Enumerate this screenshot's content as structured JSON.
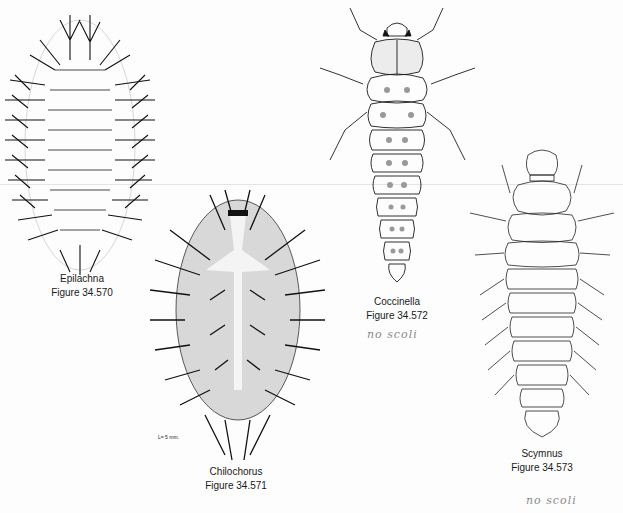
{
  "page": {
    "background": "#fdfdfd",
    "ink_color": "#111111",
    "pencil_color": "#8a8a8a"
  },
  "figures": [
    {
      "id": "epilachna",
      "genus": "Epilachna",
      "figure_number": "Figure 34.570",
      "annotation": ""
    },
    {
      "id": "chilochorus",
      "genus": "Chilochorus",
      "figure_number": "Figure 34.571",
      "scale_label": "L= 5 mm.",
      "annotation": ""
    },
    {
      "id": "coccinella",
      "genus": "Coccinella",
      "figure_number": "Figure 34.572",
      "annotation": "no scoli"
    },
    {
      "id": "scymnus",
      "genus": "Scymnus",
      "figure_number": "Figure 34.573",
      "annotation": "no scoli"
    }
  ]
}
